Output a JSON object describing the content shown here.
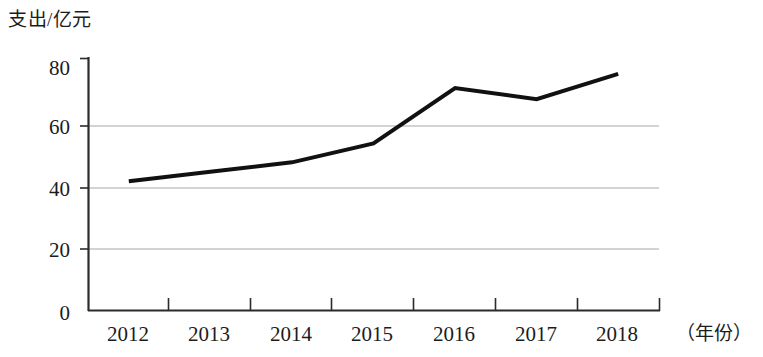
{
  "chart_data": {
    "type": "line",
    "title": "",
    "ylabel": "支出/亿元",
    "xlabel": "（年份）",
    "categories": [
      "2012",
      "2013",
      "2014",
      "2015",
      "2016",
      "2017",
      "2018"
    ],
    "values": [
      41,
      44,
      47,
      53,
      70.5,
      67,
      75
    ],
    "series": [
      {
        "name": "支出",
        "values": [
          41,
          44,
          47,
          53,
          70.5,
          67,
          75
        ]
      }
    ],
    "ylim": [
      0,
      80
    ],
    "yticks": [
      0,
      20,
      40,
      60,
      80
    ],
    "ytick_labels": [
      "0",
      "20",
      "40",
      "60",
      "80"
    ],
    "xtick_labels": [
      "2012",
      "2013",
      "2014",
      "2015",
      "2016",
      "2017",
      "2018"
    ],
    "grid": "horizontal-gridlines-at-20-40-60",
    "legend": "none",
    "line_color": "#111111",
    "grid_color": "#a8a8a8",
    "axis_color": "#2b2b2b",
    "background": "#ffffff"
  }
}
